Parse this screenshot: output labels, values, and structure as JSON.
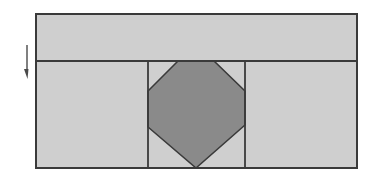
{
  "diagram": {
    "type": "geometric-block-diagram",
    "canvas": {
      "width": 372,
      "height": 176
    },
    "colors": {
      "background": "#ffffff",
      "panel_fill": "#cfcfcf",
      "octagon_fill": "#8a8a8a",
      "stroke": "#3a3a3a",
      "arrow": "#4a4a4a"
    },
    "outer_rect": {
      "x": 36,
      "y": 14,
      "width": 321,
      "height": 154
    },
    "top_band": {
      "x": 36,
      "y": 14,
      "width": 321,
      "height": 47
    },
    "divider_y": 61,
    "center_column": {
      "x1": 148,
      "x2": 245
    },
    "octagon_points": [
      [
        178,
        61
      ],
      [
        214,
        61
      ],
      [
        245,
        91
      ],
      [
        245,
        125
      ],
      [
        196,
        168
      ],
      [
        148,
        127
      ],
      [
        148,
        91
      ]
    ],
    "arrow": {
      "direction": "down",
      "x": 27,
      "y_start": 45,
      "y_end": 79
    },
    "labels": []
  }
}
